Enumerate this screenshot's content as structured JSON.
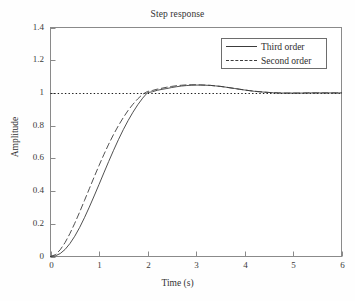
{
  "chart_data": {
    "type": "line",
    "title": "Step response",
    "xlabel": "Time (s)",
    "ylabel": "Amplitude",
    "xlim": [
      0,
      6
    ],
    "ylim": [
      0,
      1.4
    ],
    "grid": false,
    "legend_position": "upper right",
    "xticks": [
      "0",
      "1",
      "2",
      "3",
      "4",
      "5",
      "6"
    ],
    "xtick_values": [
      0,
      1,
      2,
      3,
      4,
      5,
      6
    ],
    "yticks": [
      "0",
      "0.2",
      "0.4",
      "0.6",
      "0.8",
      "1",
      "1.2",
      "1.4"
    ],
    "ytick_values": [
      0,
      0.2,
      0.4,
      0.6,
      0.8,
      1,
      1.2,
      1.4
    ],
    "reference_line": {
      "name": "steady-state",
      "y": 1,
      "style": "dotted",
      "color": "#1a1a1a"
    },
    "x": [
      0,
      0.1,
      0.2,
      0.3,
      0.4,
      0.5,
      0.6,
      0.7,
      0.8,
      0.9,
      1.0,
      1.1,
      1.2,
      1.3,
      1.4,
      1.5,
      1.6,
      1.7,
      1.8,
      1.9,
      2.0,
      2.1,
      2.2,
      2.3,
      2.4,
      2.5,
      2.6,
      2.7,
      2.8,
      2.9,
      3.0,
      3.1,
      3.2,
      3.3,
      3.4,
      3.5,
      3.6,
      3.7,
      3.8,
      3.9,
      4.0,
      4.1,
      4.2,
      4.3,
      4.4,
      4.5,
      4.6,
      4.7,
      4.8,
      4.9,
      5.0,
      5.1,
      5.2,
      5.3,
      5.4,
      5.5,
      5.6,
      5.7,
      5.8,
      5.9,
      6.0
    ],
    "series": [
      {
        "name": "Third order",
        "style": "solid",
        "color": "#3c3c3c",
        "values": [
          0.0,
          0.004,
          0.018,
          0.043,
          0.079,
          0.124,
          0.177,
          0.237,
          0.302,
          0.37,
          0.44,
          0.511,
          0.581,
          0.649,
          0.714,
          0.775,
          0.831,
          0.882,
          0.928,
          0.968,
          1.002,
          1.007,
          1.016,
          1.022,
          1.027,
          1.033,
          1.038,
          1.042,
          1.045,
          1.047,
          1.048,
          1.048,
          1.047,
          1.046,
          1.043,
          1.04,
          1.036,
          1.031,
          1.027,
          1.022,
          1.018,
          1.014,
          1.01,
          1.007,
          1.005,
          1.003,
          1.001,
          1.0,
          0.999,
          0.999,
          0.999,
          0.999,
          0.999,
          1.0,
          1.0,
          1.0,
          1.0,
          1.0,
          1.0,
          1.0,
          1.0
        ]
      },
      {
        "name": "Second order",
        "style": "dashed",
        "color": "#3c3c3c",
        "values": [
          0.0,
          0.011,
          0.041,
          0.085,
          0.14,
          0.203,
          0.271,
          0.342,
          0.414,
          0.486,
          0.556,
          0.623,
          0.687,
          0.746,
          0.8,
          0.849,
          0.893,
          0.931,
          0.964,
          0.992,
          1.009,
          1.015,
          1.023,
          1.029,
          1.035,
          1.04,
          1.044,
          1.047,
          1.049,
          1.05,
          1.05,
          1.049,
          1.048,
          1.046,
          1.043,
          1.04,
          1.036,
          1.032,
          1.027,
          1.023,
          1.018,
          1.014,
          1.011,
          1.008,
          1.005,
          1.003,
          1.001,
          1.0,
          0.999,
          0.999,
          0.999,
          0.999,
          0.999,
          1.0,
          1.0,
          1.0,
          1.0,
          1.0,
          1.0,
          1.0,
          1.0
        ]
      }
    ],
    "legend": [
      {
        "label": "Third order",
        "style": "solid"
      },
      {
        "label": "Second order",
        "style": "dashed"
      }
    ]
  }
}
